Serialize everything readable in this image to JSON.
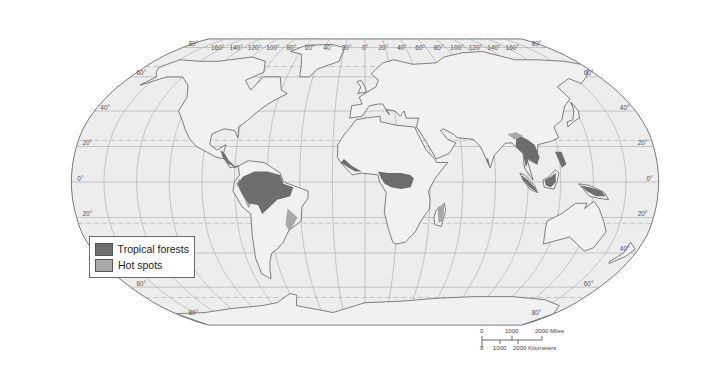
{
  "map": {
    "projection": "Robinson",
    "ocean_color": "#ededed",
    "land_color": "#f1f1f1",
    "coast_color": "#333333",
    "graticule_color": "#9a9a9a",
    "meridian_labels": [
      "160°",
      "140°",
      "120°",
      "100°",
      "80°",
      "60°",
      "40°",
      "20°",
      "0°",
      "20°",
      "40°",
      "60°",
      "80°",
      "100°",
      "120°",
      "140°",
      "160°"
    ],
    "parallel_labels_left": [
      "80°",
      "60°",
      "40°",
      "20°",
      "0°",
      "20°",
      "40°",
      "60°",
      "80°"
    ],
    "parallel_labels_right": [
      "80°",
      "60°",
      "40°",
      "20°",
      "0°",
      "20°",
      "40°",
      "60°",
      "80°"
    ],
    "tropic_lines": [
      "Tropic of Cancer",
      "Tropic of Capricorn"
    ]
  },
  "legend": {
    "items": [
      {
        "label": "Tropical forests",
        "color": "#6e6e6e"
      },
      {
        "label": "Hot spots",
        "color": "#a8a8a8"
      }
    ]
  },
  "scale_bar": {
    "miles_labels": [
      "0",
      "1000",
      "2000 Miles"
    ],
    "km_labels": [
      "0",
      "1000",
      "2000 Kilometers"
    ]
  }
}
